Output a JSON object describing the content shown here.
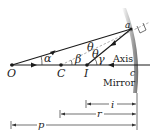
{
  "figure": {
    "points": {
      "object": "O",
      "center": "C",
      "image": "I",
      "vertex": "c",
      "reflection": "a"
    },
    "angles": {
      "object_ray": "α",
      "normal": "β",
      "incident": "θ",
      "reflected": "θ",
      "image_ray": "γ"
    },
    "labels": {
      "axis": "Axis",
      "mirror": "Mirror"
    },
    "distances": {
      "image_distance": "i",
      "radius": "r",
      "object_distance": "p"
    },
    "colors": {
      "ink": "#1a1a1a",
      "mirror_shade": "#9a9a9a"
    }
  }
}
